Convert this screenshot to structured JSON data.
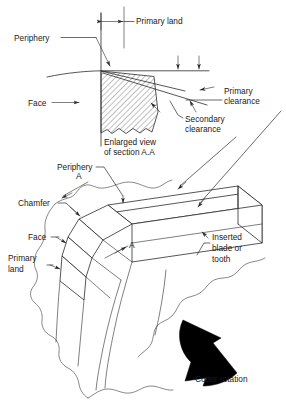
{
  "figure": {
    "background_color": "#ffffff",
    "line_color": "#2b2b2b",
    "text_color": "#1a1a1a"
  },
  "enlarged_view": {
    "caption_line1": "Enlarged view",
    "caption_line2": "of section A.A",
    "labels": {
      "primary_land": "Primary land",
      "periphery": "Periphery",
      "face": "Face",
      "primary_clearance_line1": "Primary",
      "primary_clearance_line2": "clearance",
      "secondary_clearance_line1": "Secondary",
      "secondary_clearance_line2": "clearance"
    }
  },
  "cutter_view": {
    "labels": {
      "periphery": "Periphery",
      "chamfer": "Chamfer",
      "face": "Face",
      "primary_land_line1": "Primary",
      "primary_land_line2": "land",
      "inserted_blade_line1": "Inserted",
      "inserted_blade_line2": "blade or",
      "inserted_blade_line3": "tooth",
      "cutter_rotation": "Cutter rotation"
    },
    "section_markers": {
      "upper": "A",
      "lower": "A"
    }
  }
}
